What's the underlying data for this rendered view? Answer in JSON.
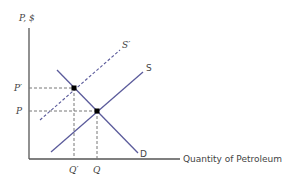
{
  "diagram": {
    "type": "supply-demand",
    "y_axis_label": "P, $",
    "x_axis_label": "Quantity of Petroleum",
    "curves": {
      "supply": "S",
      "supply_shifted": "S′",
      "demand": "D"
    },
    "price_labels": {
      "new": "P′",
      "original": "P"
    },
    "quantity_labels": {
      "new": "Q′",
      "original": "Q"
    },
    "colors": {
      "curve": "#5b5b9b",
      "axis": "#555555",
      "guide": "#777777",
      "point": "#000000"
    }
  }
}
